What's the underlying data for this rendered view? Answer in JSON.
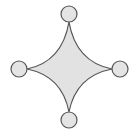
{
  "diagram": {
    "colors": {
      "background": "#ffffff",
      "shape_fill": "#e2e2e2",
      "shape_stroke": "#555555",
      "node_fill": "#e4e4e4",
      "node_stroke": "#555555"
    },
    "star": {
      "tips": {
        "top": [
          69,
          22
        ],
        "right": [
          112,
          69
        ],
        "bottom": [
          69,
          112
        ],
        "left": [
          27,
          69
        ]
      },
      "control_points": {
        "top_right": [
          76,
          62
        ],
        "bottom_right": [
          76,
          76
        ],
        "bottom_left": [
          62,
          76
        ],
        "top_left": [
          62,
          62
        ]
      }
    },
    "nodes": [
      {
        "name": "top",
        "cx": 69,
        "cy": 14,
        "r": 8
      },
      {
        "name": "right",
        "cx": 120,
        "cy": 69,
        "r": 8
      },
      {
        "name": "bottom",
        "cx": 69,
        "cy": 120,
        "r": 8
      },
      {
        "name": "left",
        "cx": 19,
        "cy": 69,
        "r": 8
      }
    ]
  }
}
